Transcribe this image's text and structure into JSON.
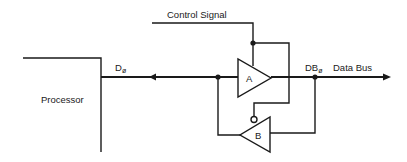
{
  "diagram": {
    "control_signal_label": "Control Signal",
    "processor_label": "Processor",
    "processor_data_label_main": "D",
    "processor_data_label_sub": "ø",
    "bus_data_label_main": "DB",
    "bus_data_label_sub": "ø",
    "data_bus_label": "Data Bus",
    "buffer_a_label": "A",
    "buffer_b_label": "B",
    "line_color": "#1a1a1a"
  }
}
